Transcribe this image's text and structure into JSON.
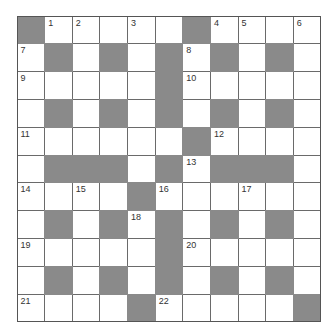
{
  "puzzle": {
    "type": "crossword",
    "size": {
      "rows": 11,
      "cols": 11
    },
    "colors": {
      "block": "#8a8a8a",
      "cell": "#ffffff",
      "line": "#6a6a6a"
    },
    "grid": [
      [
        "#",
        "1",
        "2",
        "",
        "3",
        "",
        "#",
        "4",
        "5",
        "",
        "6"
      ],
      [
        "7",
        "#",
        "",
        "#",
        "",
        "#",
        "8",
        "#",
        "",
        "#",
        ""
      ],
      [
        "9",
        "",
        "",
        "",
        "",
        "#",
        "10",
        "",
        "",
        "",
        ""
      ],
      [
        "",
        "#",
        "",
        "#",
        "",
        "#",
        "",
        "#",
        "",
        "#",
        ""
      ],
      [
        "11",
        "",
        "",
        "",
        "",
        "",
        "#",
        "12",
        "",
        "",
        ""
      ],
      [
        "",
        "#",
        "#",
        "#",
        "",
        "#",
        "13",
        "#",
        "#",
        "#",
        ""
      ],
      [
        "14",
        "",
        "15",
        "",
        "#",
        "16",
        "",
        "",
        "17",
        "",
        ""
      ],
      [
        "",
        "#",
        "",
        "#",
        "18",
        "#",
        "",
        "#",
        "",
        "#",
        ""
      ],
      [
        "19",
        "",
        "",
        "",
        "",
        "#",
        "20",
        "",
        "",
        "",
        ""
      ],
      [
        "",
        "#",
        "",
        "#",
        "",
        "#",
        "",
        "#",
        "",
        "#",
        ""
      ],
      [
        "21",
        "",
        "",
        "",
        "#",
        "22",
        "",
        "",
        "",
        "",
        "#"
      ]
    ]
  }
}
